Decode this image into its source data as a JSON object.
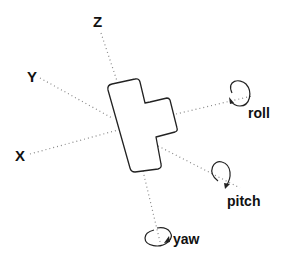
{
  "diagram": {
    "axes": {
      "z": "Z",
      "y": "Y",
      "x": "X"
    },
    "rotations": {
      "roll": "roll",
      "pitch": "pitch",
      "yaw": "yaw"
    },
    "colors": {
      "line": "#222222",
      "dotted": "#888888",
      "background": "#ffffff"
    }
  }
}
